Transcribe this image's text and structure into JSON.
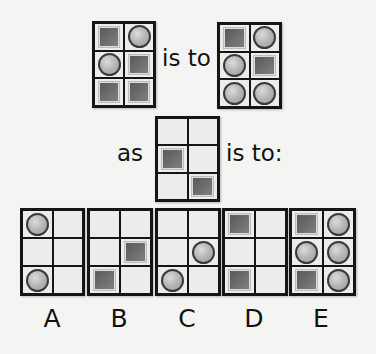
{
  "puzzle": {
    "example_source": {
      "cells": [
        "square",
        "circle",
        "circle",
        "square",
        "square",
        "square"
      ]
    },
    "connector_1": "is to",
    "example_target": {
      "cells": [
        "square",
        "circle",
        "circle",
        "square",
        "circle",
        "circle"
      ]
    },
    "connector_2": "as",
    "question_source": {
      "cells": [
        "empty",
        "empty",
        "square",
        "empty",
        "empty",
        "square"
      ]
    },
    "connector_3": "is to:"
  },
  "options": [
    {
      "label": "A",
      "cells": [
        "circle",
        "empty",
        "empty",
        "empty",
        "circle",
        "empty"
      ]
    },
    {
      "label": "B",
      "cells": [
        "empty",
        "empty",
        "empty",
        "square",
        "square",
        "empty"
      ]
    },
    {
      "label": "C",
      "cells": [
        "empty",
        "empty",
        "empty",
        "circle",
        "circle",
        "empty"
      ]
    },
    {
      "label": "D",
      "cells": [
        "square",
        "empty",
        "empty",
        "empty",
        "square",
        "empty"
      ]
    },
    {
      "label": "E",
      "cells": [
        "square",
        "circle",
        "circle",
        "circle",
        "square",
        "circle"
      ]
    }
  ],
  "colors": {
    "square_fill": "#6e6e6e",
    "circle_fill": "#b8b8b8",
    "grid_border": "#151515",
    "cell_background": "#ececea"
  }
}
